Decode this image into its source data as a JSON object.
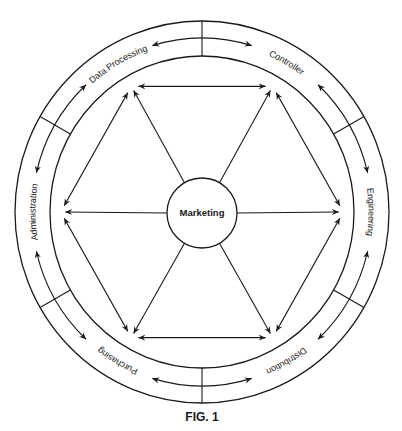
{
  "figure": {
    "caption": "FIG. 1",
    "center_label": "Marketing",
    "segments": [
      {
        "label": "Data Processing",
        "angle": 120
      },
      {
        "label": "Controller",
        "angle": 60
      },
      {
        "label": "Engineering",
        "angle": 0
      },
      {
        "label": "Distribution",
        "angle": -60
      },
      {
        "label": "Purchasing",
        "angle": -120
      },
      {
        "label": "Administration",
        "angle": 180
      }
    ],
    "divider_angles": [
      90,
      30,
      -30,
      -90,
      -150,
      150
    ],
    "colors": {
      "stroke": "#1a1a1a",
      "background": "#ffffff"
    }
  },
  "geometry": {
    "cx": 202,
    "cy": 212,
    "outer_rx": 187,
    "outer_ry": 191,
    "inner_rx": 152,
    "inner_ry": 156,
    "track_rx": 170,
    "track_ry": 174,
    "hub_r": 35
  }
}
